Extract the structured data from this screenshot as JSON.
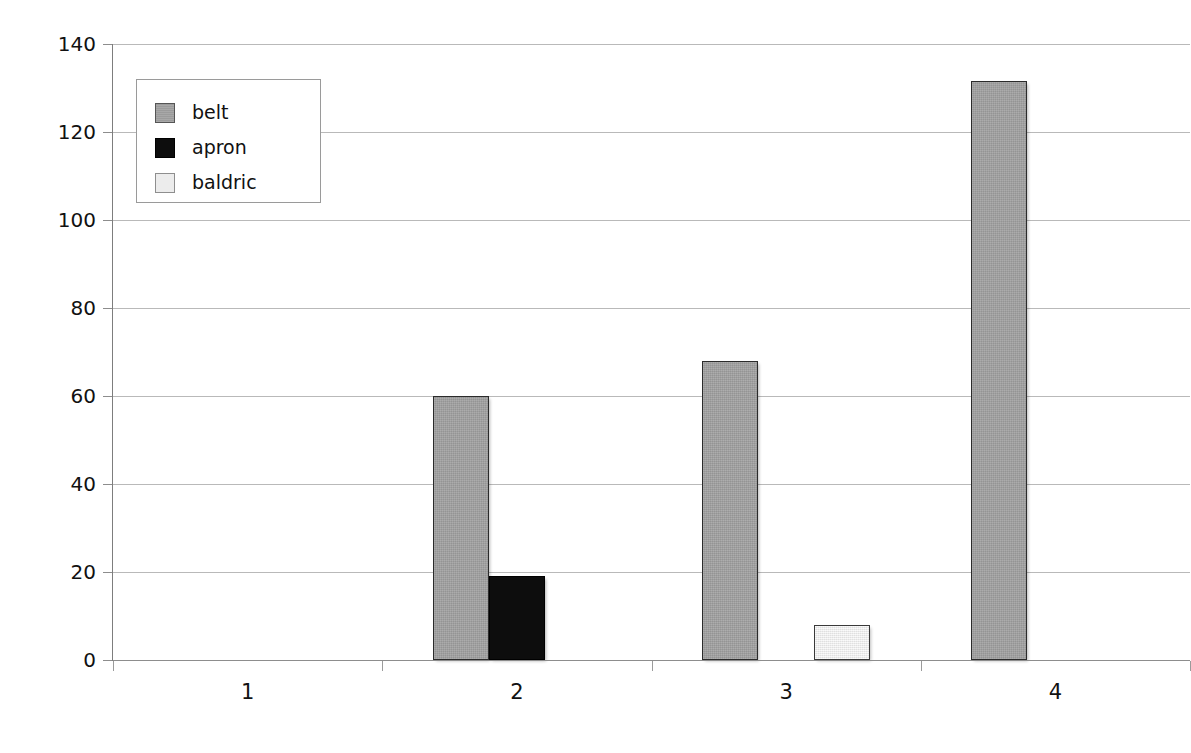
{
  "chart_data": {
    "type": "bar",
    "title": "",
    "subtitle": "",
    "xlabel": "",
    "ylabel": "",
    "categories": [
      "1",
      "2",
      "3",
      "4"
    ],
    "series": [
      {
        "name": "belt",
        "color": "#a3a3a3",
        "values": [
          0,
          60,
          68,
          131.5
        ]
      },
      {
        "name": "apron",
        "color": "#0d0d0d",
        "values": [
          0,
          19,
          0,
          0
        ]
      },
      {
        "name": "baldric",
        "color": "#ececec",
        "values": [
          0,
          0,
          8,
          0
        ]
      }
    ],
    "ylim": [
      0,
      140
    ],
    "ytick_labels": [
      "0",
      "20",
      "40",
      "60",
      "80",
      "100",
      "120",
      "140"
    ],
    "ytick_values": [
      0,
      20,
      40,
      60,
      80,
      100,
      120,
      140
    ],
    "xtick_labels": [
      "1",
      "2",
      "3",
      "4"
    ],
    "grid": true,
    "grid_axis": "y",
    "legend_position": "upper-left",
    "legend_entries": [
      "belt",
      "apron",
      "baldric"
    ],
    "background_color": "#ffffff",
    "grid_color": "#b9b9b9",
    "axis_color": "#8d8d8d",
    "bar_border_color": "#2b2b2b"
  }
}
